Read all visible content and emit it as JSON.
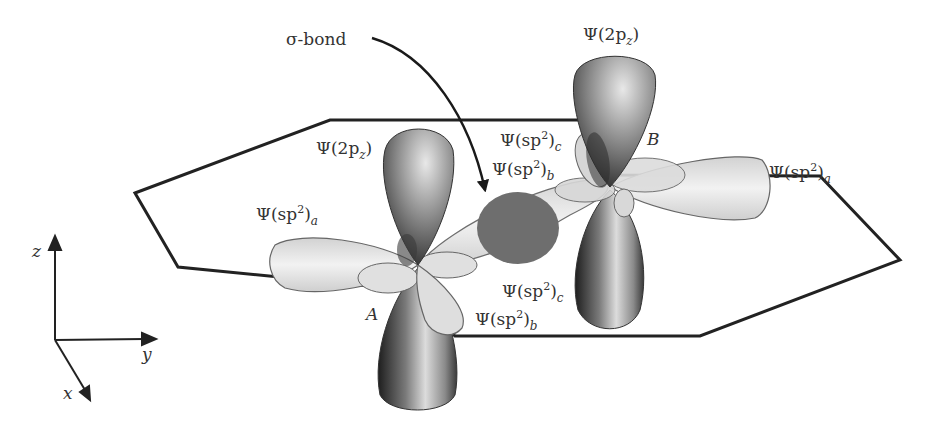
{
  "figure": {
    "atoms": {
      "a": "A",
      "b": "B"
    },
    "labels": {
      "sigma_bond": "σ-bond",
      "psi": "Ψ",
      "open": "(",
      "close": ")",
      "two_p": "2p",
      "sp": "sp",
      "sup2": "2",
      "sub_z": "z",
      "sub_a": "a",
      "sub_b": "b",
      "sub_c": "c"
    },
    "orbital_labels": [
      {
        "id": "A-2pz",
        "text": "Ψ(2pz)"
      },
      {
        "id": "A-sp2a",
        "text": "Ψ(sp2)a"
      },
      {
        "id": "A-sp2b",
        "text": "Ψ(sp2)b"
      },
      {
        "id": "A-sp2c",
        "text": "Ψ(sp2)c"
      },
      {
        "id": "B-2pz",
        "text": "Ψ(2pz)"
      },
      {
        "id": "B-sp2a",
        "text": "Ψ(sp2)a"
      },
      {
        "id": "B-sp2b",
        "text": "Ψ(sp2)b"
      },
      {
        "id": "B-sp2c",
        "text": "Ψ(sp2)c"
      }
    ],
    "axes": {
      "x": "x",
      "y": "y",
      "z": "z"
    },
    "colors": {
      "outline": "#222222",
      "p_lobe_dark": "#2a2a2a",
      "p_lobe_light": "#d8d8d8",
      "sp2_lobe": "#e6e6e6",
      "sigma_overlap": "#6e6e6e",
      "text": "#333333"
    }
  }
}
